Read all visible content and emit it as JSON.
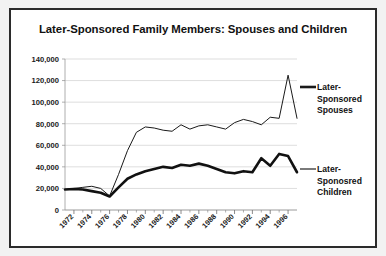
{
  "figure": {
    "title": "Later-Sponsored Family Members: Spouses and Children",
    "border_color": "#2b2b2b",
    "background_color": "#ffffff",
    "page_background": "#f2f2f2"
  },
  "legend": {
    "position": "right",
    "entries": [
      {
        "label_line1": "Later-",
        "label_line2": "Sponsored",
        "label_line3": "Spouses",
        "full_label": "Later-Sponsored Spouses",
        "color": "#1a1a1a",
        "swatch_width": 2.6
      },
      {
        "label_line1": "Later-",
        "label_line2": "Sponosred",
        "label_line3": "Children",
        "full_label": "Later-Sponosred Children",
        "color": "#7a7a7a",
        "swatch_width": 2.0
      }
    ]
  },
  "chart_data": {
    "type": "line",
    "title": "Later-Sponsored Family Members: Spouses and Children",
    "xlabel": "",
    "ylabel": "",
    "xlim": [
      1971,
      1997
    ],
    "ylim": [
      0,
      140000
    ],
    "ytick_step": 20000,
    "grid": true,
    "legend_position": "right",
    "ytick_labels": [
      "0",
      "20,000",
      "40,000",
      "60,000",
      "80,000",
      "100,000",
      "120,000",
      "140,000"
    ],
    "ytick_values": [
      0,
      20000,
      40000,
      60000,
      80000,
      100000,
      120000,
      140000
    ],
    "xtick_labels": [
      "1972",
      "1974",
      "1976",
      "1978",
      "1980",
      "1982",
      "1984",
      "1986",
      "1988",
      "1990",
      "1992",
      "1994",
      "1996"
    ],
    "xtick_values": [
      1972,
      1974,
      1976,
      1978,
      1980,
      1982,
      1984,
      1986,
      1988,
      1990,
      1992,
      1994,
      1996
    ],
    "x": [
      1971,
      1972,
      1973,
      1974,
      1975,
      1976,
      1977,
      1978,
      1979,
      1980,
      1981,
      1982,
      1983,
      1984,
      1985,
      1986,
      1987,
      1988,
      1989,
      1990,
      1991,
      1992,
      1993,
      1994,
      1995,
      1996,
      1997
    ],
    "series": [
      {
        "name": "Later-Sponsored Spouses",
        "color": "#1a1a1a",
        "line_width": 1.0,
        "values": [
          19000,
          20000,
          21000,
          22000,
          20000,
          13000,
          33000,
          55000,
          72000,
          77000,
          76000,
          74000,
          73000,
          79000,
          75000,
          78000,
          79000,
          77000,
          75000,
          81000,
          84000,
          82000,
          79000,
          86000,
          85000,
          125000,
          85000
        ]
      },
      {
        "name": "Later-Sponosred Children",
        "color": "#111111",
        "line_width": 2.6,
        "values": [
          19000,
          19500,
          19000,
          17500,
          16000,
          12500,
          21000,
          29000,
          33000,
          36000,
          38000,
          40000,
          39000,
          42000,
          41000,
          43000,
          41000,
          38000,
          35000,
          34000,
          36000,
          35000,
          48000,
          41000,
          52000,
          50000,
          35000
        ]
      }
    ]
  }
}
